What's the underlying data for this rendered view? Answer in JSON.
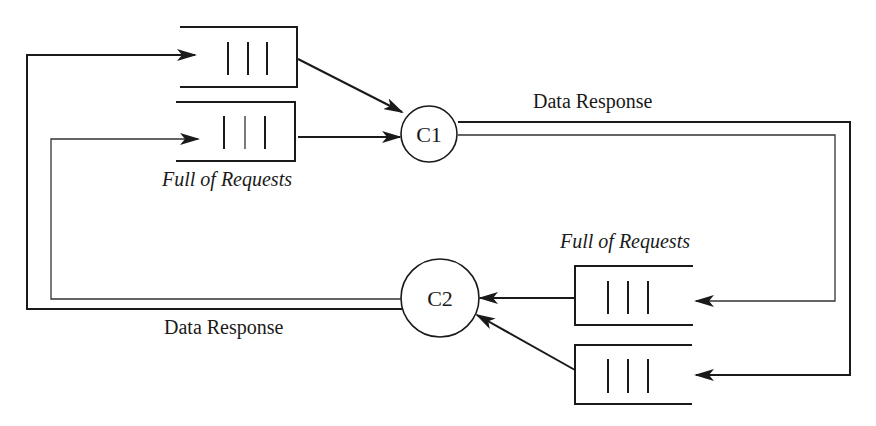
{
  "diagram": {
    "nodes": [
      {
        "id": "C1",
        "label": "C1"
      },
      {
        "id": "C2",
        "label": "C2"
      }
    ],
    "queues": [
      {
        "id": "q1",
        "feeds": "C1",
        "items": 3
      },
      {
        "id": "q2",
        "feeds": "C1",
        "items": 3,
        "caption": "Full of Requests"
      },
      {
        "id": "q3",
        "feeds": "C2",
        "items": 3,
        "caption": "Full of Requests"
      },
      {
        "id": "q4",
        "feeds": "C2",
        "items": 3
      }
    ],
    "edges": [
      {
        "from": "C1",
        "to": "q3",
        "label": "Data Response"
      },
      {
        "from": "C1",
        "to": "q4"
      },
      {
        "from": "C2",
        "to": "q1",
        "label": "Data Response"
      },
      {
        "from": "C2",
        "to": "q2"
      }
    ],
    "labels": {
      "c1": "C1",
      "c2": "C2",
      "data_response_top": "Data Response",
      "data_response_bottom": "Data Response",
      "queue_caption_top": "Full of Requests",
      "queue_caption_bottom": "Full of Requests"
    }
  }
}
